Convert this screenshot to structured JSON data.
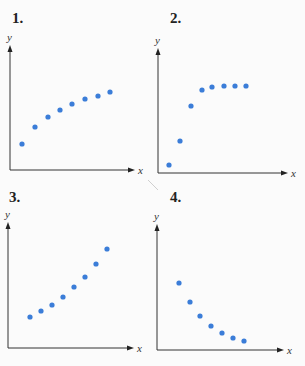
{
  "chart_data": [
    {
      "type": "scatter",
      "title": "1.",
      "xlabel": "x",
      "ylabel": "y",
      "grid": false,
      "description": "Increasing, concave down (leveling off gradually)",
      "x": [
        1,
        2,
        3,
        4,
        5,
        6,
        7,
        8
      ],
      "y": [
        2.0,
        3.4,
        4.2,
        4.8,
        5.3,
        5.7,
        6.0,
        6.3
      ],
      "pixels": [
        [
          22,
          144
        ],
        [
          35,
          127
        ],
        [
          48,
          117
        ],
        [
          60,
          110
        ],
        [
          72,
          104
        ],
        [
          85,
          99
        ],
        [
          98,
          96
        ],
        [
          110,
          92
        ]
      ],
      "axes": {
        "origin": [
          10,
          170
        ],
        "x_end": 135,
        "y_top": 45
      }
    },
    {
      "type": "scatter",
      "title": "2.",
      "xlabel": "x",
      "ylabel": "y",
      "grid": false,
      "description": "Rapid increase then plateau (logistic/saturating)",
      "x": [
        1,
        2,
        3,
        4,
        5,
        6,
        7,
        8
      ],
      "y": [
        0.6,
        2.6,
        5.4,
        6.7,
        6.9,
        7.0,
        7.0,
        7.0
      ],
      "pixels": [
        [
          169,
          165
        ],
        [
          180,
          141
        ],
        [
          191,
          106
        ],
        [
          202,
          90
        ],
        [
          212,
          87
        ],
        [
          224,
          86
        ],
        [
          235,
          86
        ],
        [
          246,
          86
        ]
      ],
      "axes": {
        "origin": [
          158,
          173
        ],
        "x_end": 288,
        "y_top": 48
      }
    },
    {
      "type": "scatter",
      "title": "3.",
      "xlabel": "x",
      "ylabel": "y",
      "grid": false,
      "description": "Increasing, concave up (exponential-like growth)",
      "x": [
        1,
        2,
        3,
        4,
        5,
        6,
        7,
        8
      ],
      "y": [
        2.5,
        3.0,
        3.5,
        4.1,
        4.9,
        5.7,
        6.8,
        8.0
      ],
      "pixels": [
        [
          30,
          317
        ],
        [
          41,
          311
        ],
        [
          52,
          305
        ],
        [
          63,
          297
        ],
        [
          74,
          287
        ],
        [
          85,
          277
        ],
        [
          96,
          264
        ],
        [
          107,
          249
        ]
      ],
      "axes": {
        "origin": [
          8,
          348
        ],
        "x_end": 134,
        "y_top": 222
      }
    },
    {
      "type": "scatter",
      "title": "4.",
      "xlabel": "x",
      "ylabel": "y",
      "grid": false,
      "description": "Decreasing, concave up (exponential decay)",
      "x": [
        1,
        2,
        3,
        4,
        5,
        6,
        7
      ],
      "y": [
        5.4,
        3.9,
        2.7,
        1.9,
        1.4,
        1.0,
        0.7
      ],
      "pixels": [
        [
          179,
          283
        ],
        [
          190,
          302
        ],
        [
          200,
          316
        ],
        [
          211,
          326
        ],
        [
          222,
          333
        ],
        [
          233,
          338
        ],
        [
          244,
          341
        ]
      ],
      "axes": {
        "origin": [
          157,
          350
        ],
        "x_end": 284,
        "y_top": 224
      }
    }
  ],
  "panels": [
    {
      "number": "1.",
      "x_label": "x",
      "y_label": "y"
    },
    {
      "number": "2.",
      "x_label": "x",
      "y_label": "y"
    },
    {
      "number": "3.",
      "x_label": "x",
      "y_label": "y"
    },
    {
      "number": "4.",
      "x_label": "x",
      "y_label": "y"
    }
  ],
  "colors": {
    "dot": "#3b7dd8",
    "axis": "#333333",
    "background": "#fbfbfb"
  }
}
